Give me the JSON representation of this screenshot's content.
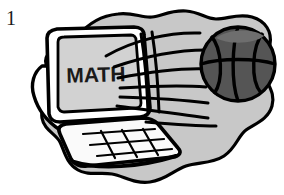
{
  "page": {
    "width": 284,
    "height": 195,
    "background": "#ffffff",
    "header_text_cropped": "of Students",
    "margin_number": "1"
  },
  "illustration": {
    "title": "Basketball flying into a laptop computer screen showing MATH",
    "style": "black-and-white clipart line art",
    "colors": {
      "outline": "#000000",
      "blob_fill": "#c8c8c8",
      "blob_shadow": "#b4b4b4",
      "laptop_body": "#ffffff",
      "laptop_edge": "#e8e8e8",
      "screen_fill": "#d2d2d2",
      "keyboard_fill": "#fafafa",
      "ball_fill": "#555555",
      "ball_seam": "#000000",
      "ball_highlight": "#6e6e6e",
      "text_color": "#1a1a1a"
    },
    "elements": [
      {
        "name": "background-blob",
        "description": "irregular cloud-shaped gray background patch"
      },
      {
        "name": "laptop",
        "description": "open laptop angled three-quarter view, white body"
      },
      {
        "name": "screen",
        "description": "light gray display panel",
        "screen_text": "MATH"
      },
      {
        "name": "keyboard",
        "description": "white trapezoidal keyboard deck with key grid lines",
        "grid_rows": 2,
        "grid_cols": 3
      },
      {
        "name": "basketball",
        "description": "dark gray basketball with black curved seams",
        "center_x": 238,
        "center_y": 64,
        "radius": 37
      },
      {
        "name": "motion-lines",
        "description": "speed streaks trailing from the basketball toward the screen",
        "count": 7
      }
    ],
    "screen_label": "MATH"
  }
}
